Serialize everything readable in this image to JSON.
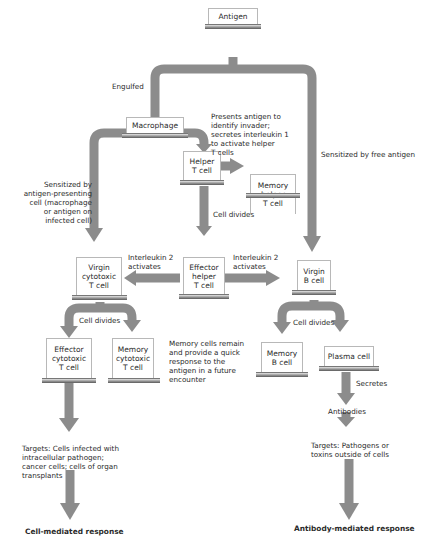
{
  "nodes": {
    "antigen": "Antigen",
    "macrophage": "Macrophage",
    "helper_t": "Helper\nT cell",
    "memory_helper_t": "Memory\nhelper\nT cell",
    "virgin_cytotoxic_t": "Virgin\ncytotoxic\nT cell",
    "effector_helper_t": "Effector\nhelper\nT cell",
    "virgin_b": "Virgin\nB cell",
    "effector_cytotoxic_t": "Effector\ncytotoxic\nT cell",
    "memory_cytotoxic_t": "Memory\ncytotoxic\nT cell",
    "memory_b": "Memory\nB cell",
    "plasma": "Plasma cell"
  },
  "labels": {
    "engulfed": "Engulfed",
    "presents": "Presents antigen to\nidentify invader;\nsecretes interleukin 1\nto activate helper\nT cells",
    "sensitized_free": "Sensitized by free antigen",
    "sensitized_apc": "Sensitized by\nantigen-presenting\ncell (macrophage\nor antigen on\ninfected cell)",
    "helper_divides": "Cell divides",
    "il2_left": "Interleukin 2\nactivates",
    "il2_right": "Interleukin 2\nactivates",
    "cyto_divides": "Cell divides",
    "b_divides": "Cell divides",
    "memory_note": "Memory cells remain\nand provide a quick\nresponse to the\nantigen in a future\nencounter",
    "secretes": "Secretes",
    "antibodies": "Antibodies",
    "targets_cell": "Targets: Cells infected with\nintracellular pathogen;\ncancer cells; cells of organ\ntransplants",
    "targets_antibody": "Targets: Pathogens or\ntoxins outside of cells",
    "cell_mediated": "Cell-mediated response",
    "antibody_mediated": "Antibody-mediated response"
  },
  "colors": {
    "arrow": "#8c8c8c",
    "box_border": "#b8b8b8",
    "text": "#2a2a2a"
  }
}
